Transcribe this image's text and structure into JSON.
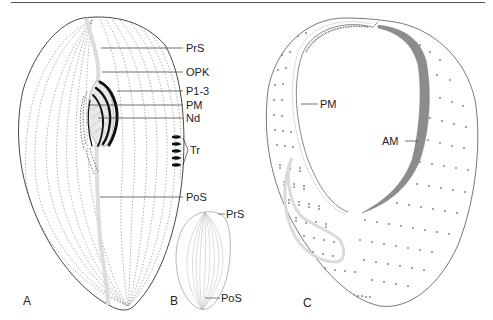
{
  "figure": {
    "panels": [
      {
        "id": "A",
        "label": "A",
        "annotations": [
          "PrS",
          "OPK",
          "P1-3",
          "PM",
          "Nd",
          "Tr",
          "PoS"
        ]
      },
      {
        "id": "B",
        "label": "B",
        "annotations": [
          "PrS",
          "PoS"
        ]
      },
      {
        "id": "C",
        "label": "C",
        "annotations": [
          "PM",
          "AM"
        ]
      }
    ],
    "colors": {
      "outline": "#333333",
      "kineties": "#888888",
      "suture": "#d8d8d8",
      "membranelles": "#111111",
      "adoral_band": "#8a8a8a"
    }
  },
  "labels": {
    "A": "A",
    "B": "B",
    "C": "C",
    "a_prs": "PrS",
    "a_opk": "OPK",
    "a_p13": "P1-3",
    "a_pm": "PM",
    "a_nd": "Nd",
    "a_tr": "Tr",
    "a_pos": "PoS",
    "b_prs": "PrS",
    "b_pos": "PoS",
    "c_pm": "PM",
    "c_am": "AM"
  }
}
